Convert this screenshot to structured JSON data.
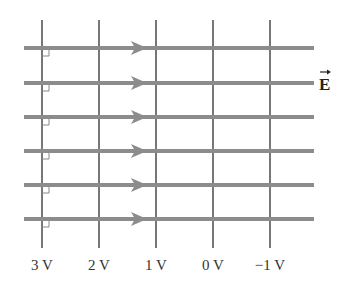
{
  "diagram": {
    "field_label": "E",
    "field_label_has_vector_arrow": true,
    "equipotentials": [
      {
        "label": "3 V",
        "x": 42
      },
      {
        "label": "2 V",
        "x": 99
      },
      {
        "label": "1 V",
        "x": 156
      },
      {
        "label": "0 V",
        "x": 213
      },
      {
        "label": "−1 V",
        "x": 270
      }
    ],
    "field_lines_y": [
      48,
      83,
      117,
      151,
      185,
      219
    ],
    "field_direction": "right",
    "right_angle_markers": true,
    "colors": {
      "field_line": "#8c8c8c",
      "equipotential_line": "#777777",
      "text": "#333333"
    }
  }
}
